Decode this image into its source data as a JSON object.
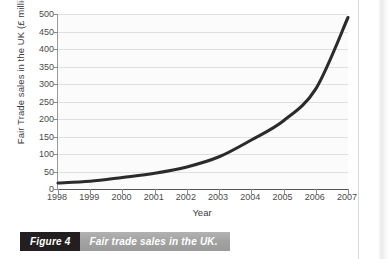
{
  "chart_data": {
    "type": "line",
    "title": "",
    "xlabel": "Year",
    "ylabel": "Fair Trade sales in the UK (£ million)",
    "x": [
      1998,
      1999,
      2000,
      2001,
      2002,
      2003,
      2004,
      2005,
      2006,
      2007
    ],
    "categories": [
      "1998",
      "1999",
      "2000",
      "2001",
      "2002",
      "2003",
      "2004",
      "2005",
      "2006",
      "2007"
    ],
    "values": [
      17,
      22,
      33,
      45,
      63,
      92,
      140,
      195,
      286,
      490
    ],
    "series": [
      {
        "name": "Fair trade sales in the UK",
        "values": [
          17,
          22,
          33,
          45,
          63,
          92,
          140,
          195,
          286,
          490
        ]
      }
    ],
    "ylim": [
      0,
      500
    ],
    "xlim": [
      1998,
      2007
    ],
    "ytick_labels": [
      "0",
      "50",
      "100",
      "150",
      "200",
      "250",
      "300",
      "350",
      "400",
      "450",
      "500"
    ],
    "ytick_values": [
      0,
      50,
      100,
      150,
      200,
      250,
      300,
      350,
      400,
      450,
      500
    ],
    "grid": "horizontal",
    "legend": "none",
    "line_color": "#2b2b2b",
    "plot_background": "#fbfbfb",
    "gridline_color": "#dfdfdf"
  },
  "caption": {
    "badge": "Figure 4",
    "text": "Fair trade sales in the UK.",
    "badge_color": "#231f20",
    "text_background": "#a6a6a6"
  }
}
